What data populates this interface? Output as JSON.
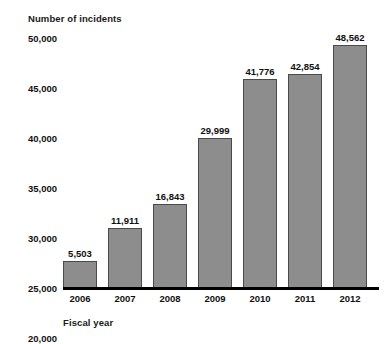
{
  "chart_data": {
    "type": "bar",
    "title": "",
    "xlabel": "Fiscal year",
    "ylabel": "Number of incidents",
    "categories": [
      "2006",
      "2007",
      "2008",
      "2009",
      "2010",
      "2011",
      "2012"
    ],
    "values": [
      5503,
      11911,
      16843,
      29999,
      41776,
      42854,
      48562
    ],
    "value_labels": [
      "5,503",
      "11,911",
      "16,843",
      "29,999",
      "41,776",
      "42,854",
      "48,562"
    ],
    "ylim": [
      0,
      50000
    ],
    "ytick_values": [
      0,
      5000,
      10000,
      15000,
      20000,
      25000,
      30000,
      35000,
      40000,
      45000,
      50000
    ],
    "ytick_labels": [
      "0",
      "5,000",
      "10,000",
      "15,000",
      "20,000",
      "25,000",
      "30,000",
      "35,000",
      "40,000",
      "45,000",
      "50,000"
    ],
    "grid": false,
    "legend": null,
    "bar_color": "#8d8d8d",
    "bar_border_color": "#4a4a4a",
    "axis_color": "#000000",
    "text_color": "#111111"
  }
}
